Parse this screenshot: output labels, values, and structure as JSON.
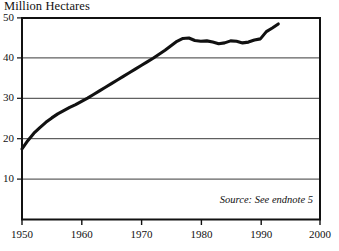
{
  "chart_data": {
    "type": "line",
    "title": "Million Hectares",
    "xlabel": "",
    "ylabel": "Million Hectares",
    "xlim": [
      1950,
      2000
    ],
    "ylim": [
      0,
      50
    ],
    "grid": true,
    "legend": null,
    "annotations": [
      {
        "name": "source-note",
        "text": "Source: See endnote 5"
      }
    ],
    "y_ticks": [
      10,
      20,
      30,
      40,
      50
    ],
    "y_tick_labels": [
      "10",
      "20",
      "30",
      "40",
      "50"
    ],
    "x_ticks": [
      1950,
      1960,
      1970,
      1980,
      1990,
      2000
    ],
    "x_tick_labels": [
      "1950",
      "1960",
      "1970",
      "1980",
      "1990",
      "2000"
    ],
    "series": [
      {
        "name": "Irrigated Area",
        "color": "#111111",
        "x": [
          1950,
          1951,
          1952,
          1953,
          1954,
          1955,
          1956,
          1957,
          1958,
          1959,
          1960,
          1961,
          1962,
          1963,
          1964,
          1965,
          1966,
          1967,
          1968,
          1969,
          1970,
          1971,
          1972,
          1973,
          1974,
          1975,
          1976,
          1977,
          1978,
          1979,
          1980,
          1981,
          1982,
          1983,
          1984,
          1985,
          1986,
          1987,
          1988,
          1989,
          1990,
          1991,
          1992,
          1993
        ],
        "values": [
          17.5,
          19.6,
          21.4,
          22.8,
          24.1,
          25.2,
          26.2,
          27.0,
          27.8,
          28.5,
          29.3,
          30.1,
          31.0,
          31.9,
          32.8,
          33.7,
          34.6,
          35.5,
          36.4,
          37.3,
          38.2,
          39.1,
          40.0,
          41.0,
          42.0,
          43.1,
          44.2,
          44.9,
          45.0,
          44.4,
          44.2,
          44.3,
          44.0,
          43.6,
          43.8,
          44.3,
          44.2,
          43.8,
          44.0,
          44.5,
          44.8,
          46.6,
          47.5,
          48.5
        ]
      }
    ]
  },
  "axes": {
    "title": "Million Hectares"
  }
}
